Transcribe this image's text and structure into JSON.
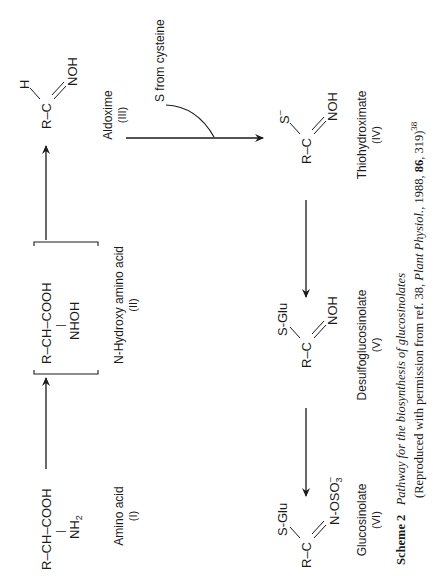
{
  "scheme": {
    "compounds": [
      {
        "id": "I",
        "name": "Amino acid",
        "numeral": "(I)",
        "formula_main": "R–CH–COOH",
        "formula_sub_group": "NH",
        "formula_sub_index": "2"
      },
      {
        "id": "II",
        "name": "N-Hydroxy amino acid",
        "numeral": "(II)",
        "formula_main": "R–CH–COOH",
        "formula_sub_group": "NHOH"
      },
      {
        "id": "III",
        "name": "Aldoxime",
        "numeral": "(III)",
        "formula_core": "R–C",
        "top_group": "H",
        "bottom_group": "NOH"
      },
      {
        "id": "IV",
        "name": "Thiohydroximate",
        "numeral": "(IV)",
        "formula_core": "R–C",
        "top_group": "S",
        "top_charge": "–",
        "bottom_group": "NOH"
      },
      {
        "id": "V",
        "name": "Desulfoglucosinolate",
        "numeral": "(V)",
        "formula_core": "R–C",
        "top_group": "S-Glu",
        "bottom_group": "NOH"
      },
      {
        "id": "VI",
        "name": "Glucosinolate",
        "numeral": "(VI)",
        "formula_core": "R–C",
        "top_group": "S-Glu",
        "bottom_group": "N-OSO",
        "bottom_index": "3",
        "bottom_charge": "–"
      }
    ],
    "bond_bar": "|",
    "side_input": "S from cysteine"
  },
  "caption": {
    "label": "Scheme 2",
    "title": "Pathway for the biosynthesis of glucosinolates",
    "line2_prefix": "(Reproduced with permission from ref. 38, ",
    "journal": "Plant Physiol.",
    "line2_mid": ", 1988, ",
    "volume": "86",
    "line2_suffix": ", 319)",
    "ref_sup": "38"
  }
}
